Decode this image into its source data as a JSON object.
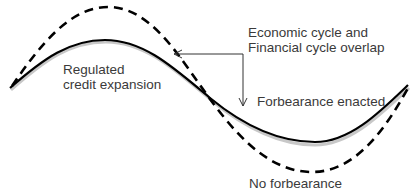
{
  "diagram": {
    "title": "",
    "labels": {
      "overlap": {
        "line1": "Economic cycle and",
        "line2": "Financial cycle overlap"
      },
      "regulated": {
        "line1": "Regulated",
        "line2": "credit expansion"
      },
      "forbearance_enacted": "Forbearance enacted",
      "no_forbearance": "No forbearance"
    },
    "series": [
      {
        "name": "Forbearance enacted",
        "style": "solid",
        "color": "#000000",
        "shadow_color": "#c8c8c8"
      },
      {
        "name": "No forbearance",
        "style": "dashed",
        "color": "#000000"
      }
    ],
    "annotation": {
      "type": "elbow-arrow",
      "description": "Points from overlap label to where the cycles overlap on both curves",
      "color": "#333333"
    }
  }
}
